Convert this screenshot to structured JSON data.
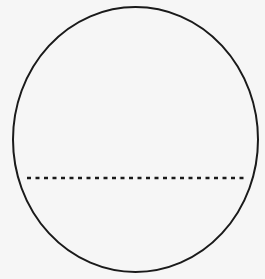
{
  "diagram": {
    "shapes": [
      {
        "type": "circle",
        "name": "outer-circle",
        "cx": 135.5,
        "cy": 139.5,
        "rx": 122.5,
        "ry": 132.5,
        "stroke": "#1a1a1a",
        "stroke_width": 2,
        "fill": "#f6f6f6"
      },
      {
        "type": "line",
        "name": "dashed-chord",
        "x1": 27,
        "y1": 178,
        "x2": 244,
        "y2": 178,
        "stroke": "#1a1a1a",
        "stroke_width": 2.5,
        "dasharray": "4,4.5"
      }
    ],
    "background": "#f6f6f6"
  }
}
